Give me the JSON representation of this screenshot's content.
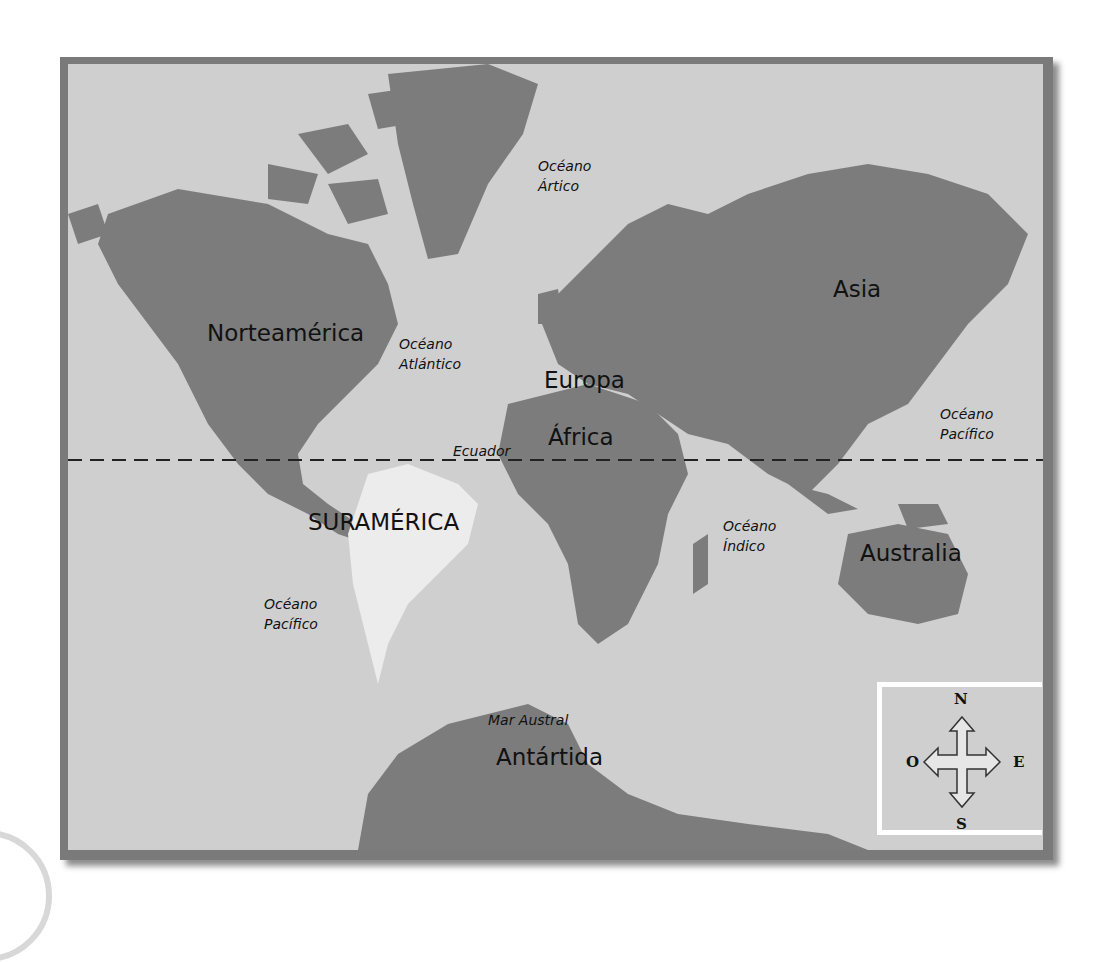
{
  "map": {
    "continents": [
      {
        "id": "north-america",
        "label": "Norteamérica"
      },
      {
        "id": "south-america",
        "label": "SURAMÉRICA"
      },
      {
        "id": "europe",
        "label": "Europa"
      },
      {
        "id": "africa",
        "label": "África"
      },
      {
        "id": "asia",
        "label": "Asia"
      },
      {
        "id": "australia",
        "label": "Australia"
      },
      {
        "id": "antarctica",
        "label": "Antártida"
      }
    ],
    "oceans": [
      {
        "id": "arctic",
        "line1": "Océano",
        "line2": "Ártico"
      },
      {
        "id": "atlantic",
        "line1": "Océano",
        "line2": "Atlántico"
      },
      {
        "id": "pacific-east",
        "line1": "Océano",
        "line2": "Pacífico"
      },
      {
        "id": "pacific-west",
        "line1": "Océano",
        "line2": "Pacífico"
      },
      {
        "id": "indian",
        "line1": "Océano",
        "line2": "Índico"
      },
      {
        "id": "southern",
        "line1": "Mar Austral"
      }
    ],
    "equator_label": "Ecuador",
    "compass": {
      "north": "N",
      "south": "S",
      "east": "E",
      "west": "O"
    },
    "colors": {
      "land": "#7c7c7c",
      "sea": "#cfcfcf",
      "highlight": "#ececec",
      "frame": "#7a7a7a"
    }
  }
}
